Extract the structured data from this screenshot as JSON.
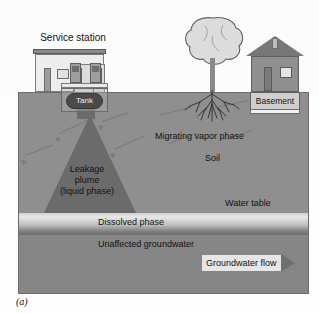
{
  "figure": {
    "caption": "(a)",
    "title_above_ground": "Service station"
  },
  "surface": {
    "station": {
      "label": "Service station",
      "icons": [
        "service-station-building-icon",
        "fuel-pump-icon"
      ]
    },
    "tank": {
      "label": "Tank",
      "icon": "underground-storage-tank-icon"
    },
    "tree": {
      "icon": "tree-icon"
    },
    "house": {
      "icon": "house-icon",
      "basement_label": "Basement"
    }
  },
  "subsurface": {
    "labels": {
      "migrating_vapor": "Migrating vapor phase",
      "soil": "Soil",
      "water_table": "Water table",
      "leakage_plume_line1": "Leakage",
      "leakage_plume_line2": "plume",
      "leakage_plume_line3": "(liquid phase)",
      "dissolved_phase": "Dissolved phase",
      "unaffected_groundwater": "Unaffected groundwater",
      "groundwater_flow": "Groundwater flow"
    }
  },
  "colors": {
    "soil": "#8f8f8f",
    "plume": "#6b6b6b",
    "groundwater": "#868686",
    "dissolved_band_light": "#e8e8e8",
    "dissolved_band_dark": "#6e6e6e",
    "flow_arrow": "#6f6f6f",
    "flow_label_bg": "#e6e6e6",
    "page_background": "#fdfdfd"
  }
}
